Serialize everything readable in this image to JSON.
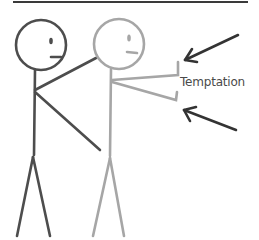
{
  "diagram": {
    "label": "Temptation",
    "colors": {
      "background": "#ffffff",
      "top_rule": "#3a3a3a",
      "dark_figure": "#4d4d4d",
      "light_figure": "#a6a6a6",
      "arrows": "#333333",
      "label_text": "#4a4a4a"
    },
    "figures": [
      {
        "name": "restraining-figure",
        "tone": "dark"
      },
      {
        "name": "tempted-figure",
        "tone": "light"
      }
    ],
    "arrows": [
      {
        "name": "upper-arrow",
        "direction": "down-left"
      },
      {
        "name": "lower-arrow",
        "direction": "up-left"
      }
    ]
  }
}
